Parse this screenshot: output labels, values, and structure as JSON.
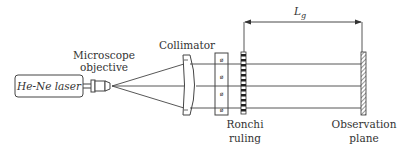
{
  "diagram": {
    "type": "optical-setup",
    "components": {
      "laser": {
        "label": "He-Ne laser"
      },
      "objective": {
        "label_line1": "Microscope",
        "label_line2": "objective"
      },
      "collimator": {
        "label": "Collimator"
      },
      "ronchi": {
        "label_line1": "Ronchi",
        "label_line2": "ruling"
      },
      "observation": {
        "label_line1": "Observation",
        "label_line2": "plane"
      }
    },
    "dimension": {
      "symbol": "L",
      "subscript": "g"
    },
    "colors": {
      "stroke": "#333333",
      "background": "#ffffff"
    }
  }
}
